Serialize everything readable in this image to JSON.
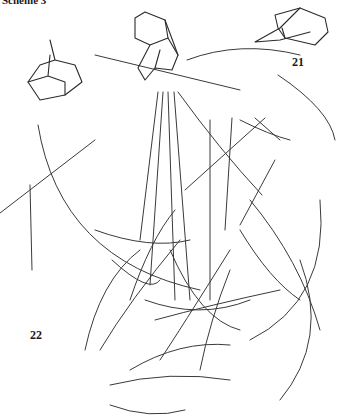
{
  "title": "Scheme 3",
  "diagram": {
    "type": "reaction-network",
    "node_count": 16,
    "labels": [
      {
        "id": "21",
        "text": "21"
      },
      {
        "id": "22",
        "text": "22"
      }
    ],
    "marked_atoms": 2
  },
  "colors": {
    "ink": "#2a2a2a",
    "background": "#ffffff"
  }
}
